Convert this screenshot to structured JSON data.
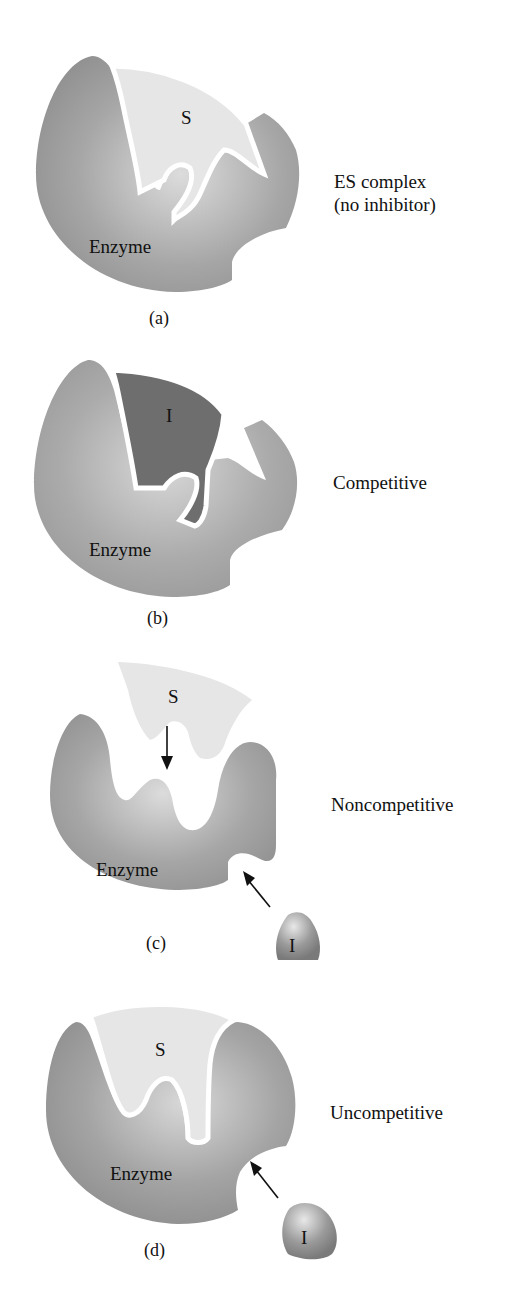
{
  "figure": {
    "colors": {
      "enzyme": "#9a9a9a",
      "enzyme_light": "#d0d0d0",
      "substrate": "#e4e4e4",
      "inhibitor_bound": "#6e6e6e",
      "inhibitor_free": "#8c8c8c",
      "background": "#ffffff"
    },
    "panels": [
      {
        "id": "a",
        "caption": "(a)",
        "enzyme_label": "Enzyme",
        "substrate_label": "S",
        "description_line1": "ES complex",
        "description_line2": "(no inhibitor)"
      },
      {
        "id": "b",
        "caption": "(b)",
        "enzyme_label": "Enzyme",
        "inhibitor_label": "I",
        "description": "Competitive"
      },
      {
        "id": "c",
        "caption": "(c)",
        "enzyme_label": "Enzyme",
        "substrate_label": "S",
        "inhibitor_label": "I",
        "description": "Noncompetitive",
        "arrows": [
          "substrate-to-active-site",
          "inhibitor-to-allosteric-site"
        ]
      },
      {
        "id": "d",
        "caption": "(d)",
        "enzyme_label": "Enzyme",
        "substrate_label": "S",
        "inhibitor_label": "I",
        "description": "Uncompetitive",
        "arrows": [
          "inhibitor-to-allosteric-site"
        ]
      }
    ]
  }
}
